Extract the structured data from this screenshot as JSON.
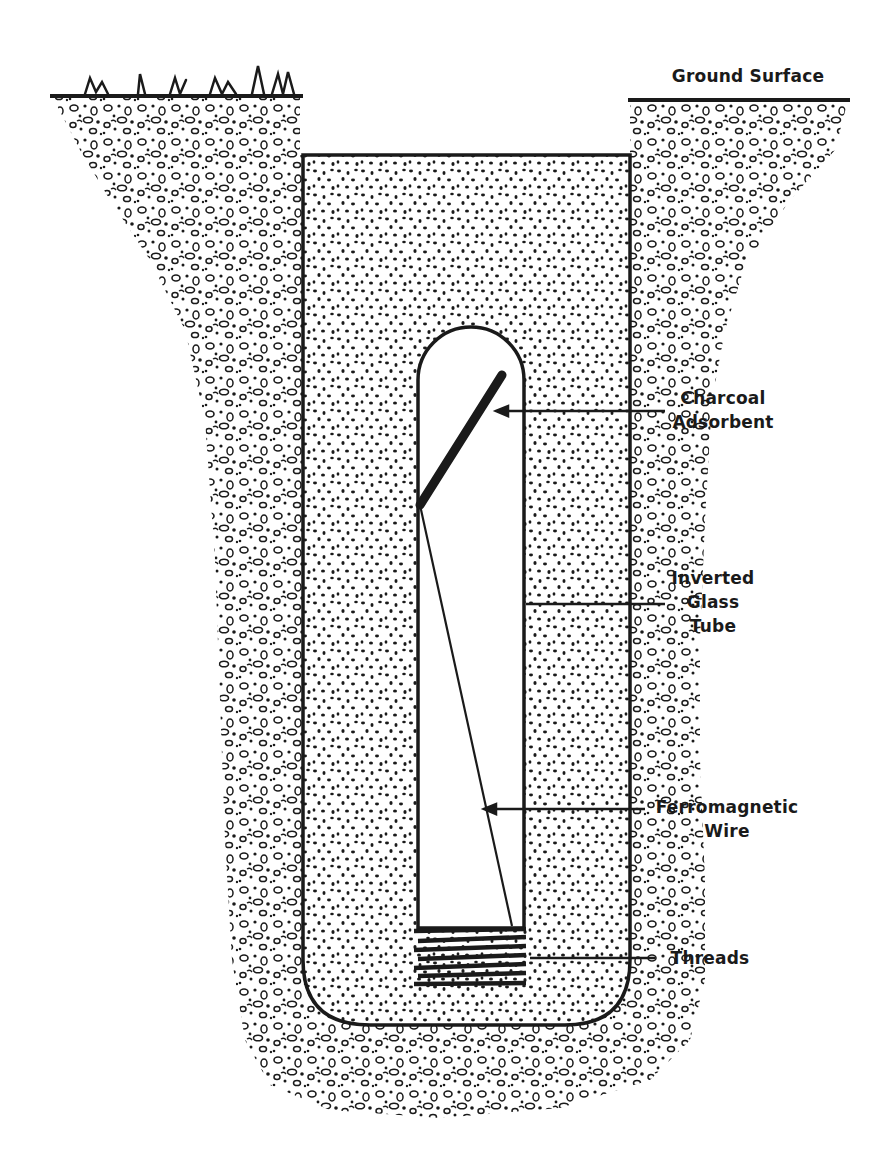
{
  "diagram": {
    "type": "cross-section",
    "colors": {
      "ink": "#1a1a1a",
      "background": "#ffffff"
    },
    "labels": {
      "ground_surface": "Ground Surface",
      "charcoal": [
        "Charcoal",
        "Adsorbent"
      ],
      "tube": [
        "Inverted",
        "Glass",
        "Tube"
      ],
      "wire": [
        "Ferromagnetic",
        "Wire"
      ],
      "threads": "Threads"
    },
    "components": [
      {
        "id": "native-soil",
        "description": "coarse native soil / gravel surrounding the pit"
      },
      {
        "id": "backfill",
        "description": "fine-grained backfill inside the excavation"
      },
      {
        "id": "glass-tube",
        "description": "inverted glass tube with rounded top"
      },
      {
        "id": "charcoal-adsorbent",
        "description": "diagonal charcoal adsorbent element at top of tube"
      },
      {
        "id": "ferromagnetic-wire",
        "description": "wire running from adsorbent down to the threads"
      },
      {
        "id": "threads",
        "description": "threaded cap region at the tube mouth"
      },
      {
        "id": "grass",
        "description": "grass tufts at ground surface (left)"
      }
    ]
  }
}
